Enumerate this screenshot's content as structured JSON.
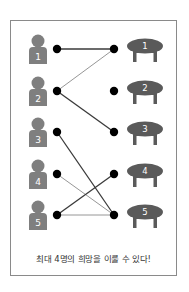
{
  "colors": {
    "person": "#7f7f7f",
    "table": "#5a5a5a",
    "dot": "#000000",
    "edge_dark": "#3a3a3a",
    "edge_light": "#8a8a8a",
    "label": "#ffffff",
    "border": "#8a8a8a"
  },
  "people": [
    {
      "label": "1",
      "y": 49
    },
    {
      "label": "2",
      "y": 91
    },
    {
      "label": "3",
      "y": 132
    },
    {
      "label": "4",
      "y": 174
    },
    {
      "label": "5",
      "y": 215
    }
  ],
  "tables": [
    {
      "label": "1",
      "y": 49
    },
    {
      "label": "2",
      "y": 91
    },
    {
      "label": "3",
      "y": 132
    },
    {
      "label": "4",
      "y": 174
    },
    {
      "label": "5",
      "y": 215
    }
  ],
  "edges": [
    {
      "from": "1",
      "to": "1",
      "style": "dark"
    },
    {
      "from": "2",
      "to": "1",
      "style": "light"
    },
    {
      "from": "2",
      "to": "3",
      "style": "dark"
    },
    {
      "from": "3",
      "to": "5",
      "style": "dark"
    },
    {
      "from": "4",
      "to": "5",
      "style": "light"
    },
    {
      "from": "5",
      "to": "4",
      "style": "dark"
    },
    {
      "from": "5",
      "to": "5",
      "style": "light"
    }
  ],
  "caption": "최대 4명의 희망을 이룰 수 있다!"
}
